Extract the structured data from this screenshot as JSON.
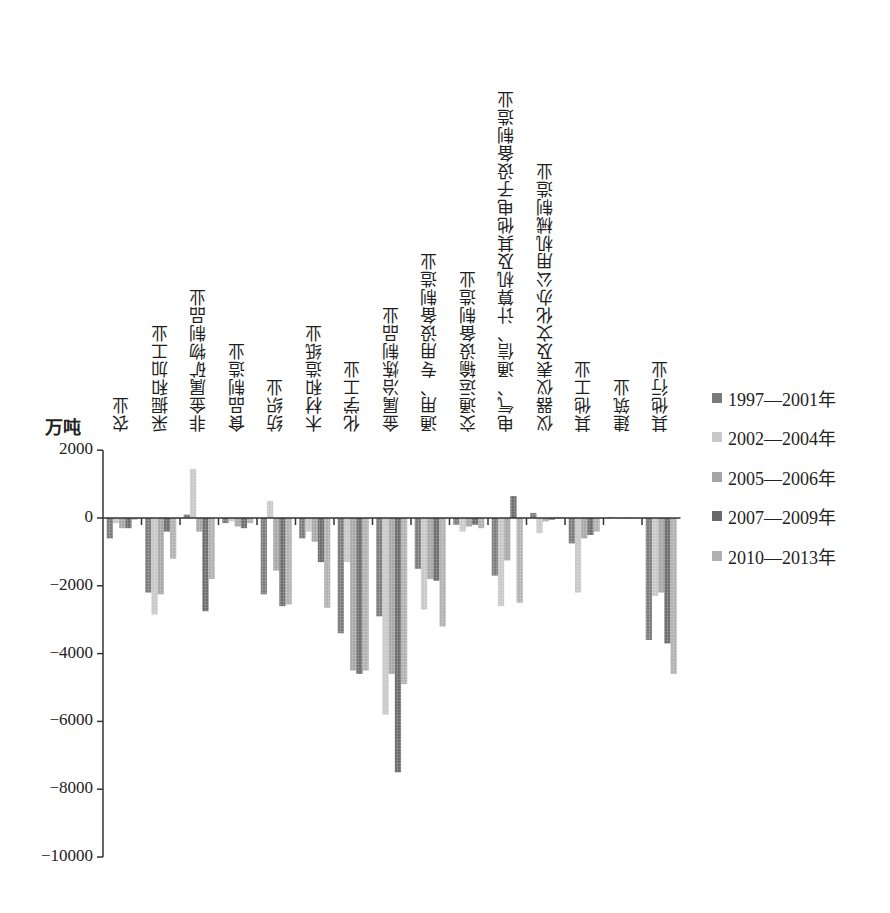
{
  "chart_data": {
    "type": "bar",
    "title": "",
    "xlabel": "",
    "ylabel": "万吨",
    "ylim": [
      -10000,
      2000
    ],
    "yticks": [
      2000,
      0,
      -2000,
      -4000,
      -6000,
      -8000,
      -10000
    ],
    "ytick_labels": [
      "2000",
      "0",
      "-2000",
      "-4000",
      "-6000",
      "-8000",
      "-10000"
    ],
    "grid": false,
    "legend_position": "right",
    "categories": [
      "农业",
      "采掘和加工业",
      "非金属矿物制品业",
      "食品制造业",
      "纺织业",
      "木材和造纸业",
      "化学工业",
      "金属冶炼制品业",
      "通用、专用设备制造业",
      "交通运输设备制造业",
      "电气、通信、计算机及其他电子设备制造业",
      "仪器仪表及文化办公用机械制造业",
      "其他工业",
      "建筑业",
      "其他行业"
    ],
    "series": [
      {
        "name": "1997—2001年",
        "color": "#7a7a7a",
        "values": [
          -600,
          -2200,
          100,
          -150,
          -2250,
          -600,
          -3400,
          -2900,
          -1500,
          -200,
          -1700,
          150,
          -750,
          20,
          -3600
        ]
      },
      {
        "name": "2002—2004年",
        "color": "#c8c8c8",
        "values": [
          -150,
          -2850,
          1450,
          -100,
          500,
          -400,
          -1300,
          -5800,
          -2700,
          -400,
          -2600,
          -450,
          -2200,
          10,
          -2300
        ]
      },
      {
        "name": "2005—2006年",
        "color": "#a6a6a6",
        "values": [
          -300,
          -2250,
          -400,
          -250,
          -1550,
          -700,
          -4500,
          -4600,
          -1800,
          -250,
          -1250,
          -100,
          -600,
          0,
          -2200
        ]
      },
      {
        "name": "2007—2009年",
        "color": "#6a6a6a",
        "values": [
          -300,
          -400,
          -2750,
          -300,
          -2600,
          -1300,
          -4600,
          -7500,
          -1850,
          -200,
          650,
          -50,
          -500,
          10,
          -3700
        ]
      },
      {
        "name": "2010—2013年",
        "color": "#b0b0b0",
        "values": [
          -50,
          -1200,
          -1800,
          -150,
          -2550,
          -2650,
          -4500,
          -4900,
          -3200,
          -300,
          -2500,
          30,
          -400,
          0,
          -4600
        ]
      }
    ]
  }
}
